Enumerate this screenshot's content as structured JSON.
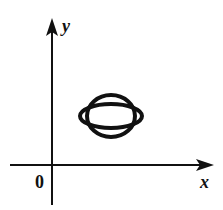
{
  "diagram": {
    "axes": {
      "x_label": "x",
      "y_label": "y",
      "origin_label": "0"
    },
    "shapes": [
      {
        "name": "horizontal-ellipse",
        "cx": 111,
        "cy": 116,
        "rx": 31,
        "ry": 12
      },
      {
        "name": "vertical-ellipse",
        "cx": 111,
        "cy": 116,
        "rx": 24,
        "ry": 21
      }
    ],
    "colors": {
      "stroke": "#111111",
      "background": "#ffffff"
    }
  }
}
